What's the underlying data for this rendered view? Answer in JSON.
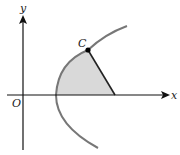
{
  "diagram": {
    "type": "parabola-region",
    "labels": {
      "x_axis": "x",
      "y_axis": "y",
      "origin": "O",
      "point": "C"
    },
    "colors": {
      "axis": "#111111",
      "curve": "#777777",
      "segment": "#222222",
      "shaded_region": "#d9d9d9",
      "point": "#000000"
    },
    "elements": [
      "x-axis with arrow",
      "y-axis with arrow",
      "parabola opening right",
      "point C on upper branch",
      "line segment from C to x-axis",
      "shaded region bounded by parabola, segment and x-axis"
    ]
  }
}
